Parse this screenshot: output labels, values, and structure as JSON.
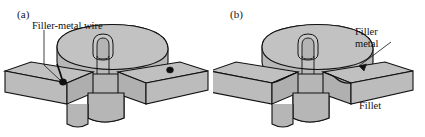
{
  "figure": {
    "type": "technical-illustration",
    "background_color": "#ffffff",
    "line_color": "#111111",
    "fill_gray": "#b8b8b8",
    "fill_gray_dark": "#a9a9a9",
    "fill_gray_light": "#c4c4c4",
    "wire_color": "#101010"
  },
  "panels": [
    {
      "id": "a",
      "label": "(a)",
      "callouts": [
        {
          "id": "filler-metal-wire",
          "text": "Filler-metal wire",
          "lines": [
            "Filler-metal wire"
          ]
        }
      ],
      "markers": [
        {
          "id": "wire-left",
          "shape": "black-dot"
        },
        {
          "id": "wire-right",
          "shape": "black-dot"
        }
      ]
    },
    {
      "id": "b",
      "label": "(b)",
      "callouts": [
        {
          "id": "filler-metal",
          "text": "Filler metal",
          "lines": [
            "Filler",
            "metal"
          ]
        },
        {
          "id": "fillet",
          "text": "Fillet",
          "lines": [
            "Fillet"
          ]
        }
      ],
      "markers": []
    }
  ]
}
